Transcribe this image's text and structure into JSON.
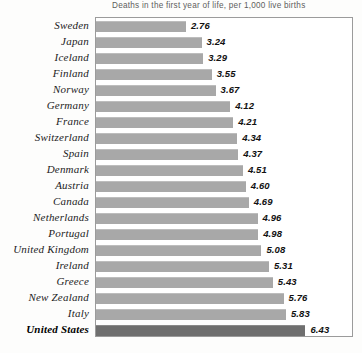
{
  "chart_data": {
    "type": "bar",
    "orientation": "horizontal",
    "title": "Deaths in the first year of life, per 1,000 live births",
    "xlabel": "",
    "ylabel": "",
    "xlim": [
      0,
      7.0
    ],
    "grid": false,
    "legend": "none",
    "categories": [
      "Sweden",
      "Japan",
      "Iceland",
      "Finland",
      "Norway",
      "Germany",
      "France",
      "Switzerland",
      "Spain",
      "Denmark",
      "Austria",
      "Canada",
      "Netherlands",
      "Portugal",
      "United Kingdom",
      "Ireland",
      "Greece",
      "New Zealand",
      "Italy",
      "United States"
    ],
    "values": [
      2.76,
      3.24,
      3.29,
      3.55,
      3.67,
      4.12,
      4.21,
      4.34,
      4.37,
      4.51,
      4.6,
      4.69,
      4.96,
      4.98,
      5.08,
      5.31,
      5.43,
      5.76,
      5.83,
      6.43
    ],
    "value_labels": [
      "2.76",
      "3.24",
      "3.29",
      "3.55",
      "3.67",
      "4.12",
      "4.21",
      "4.34",
      "4.37",
      "4.51",
      "4.60",
      "4.69",
      "4.96",
      "4.98",
      "5.08",
      "5.31",
      "5.43",
      "5.76",
      "5.83",
      "6.43"
    ],
    "highlight_category": "United States",
    "colors": {
      "bar": "#a8a8a8",
      "highlight_bar": "#6f6f6f",
      "frame": "#9b9b9b",
      "title_text": "#5d5d5d",
      "label_text": "#1c1c1c",
      "value_text": "#111111",
      "background": "#fdfdfc"
    }
  },
  "footer": {
    "source_note": ""
  }
}
